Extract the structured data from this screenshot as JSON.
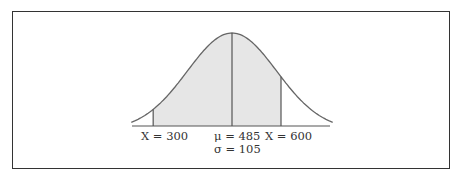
{
  "figure": {
    "type": "normal-distribution-diagram",
    "mean_label": "μ = 485",
    "sd_label": "σ = 105",
    "left_label": "X = 300",
    "right_label": "X = 600",
    "mean": 485,
    "sd": 105,
    "shaded_from": 300,
    "shaded_to": 600,
    "colors": {
      "frame": "#333333",
      "curve": "#666666",
      "shade": "#e6e6e6",
      "text": "#333333"
    }
  }
}
